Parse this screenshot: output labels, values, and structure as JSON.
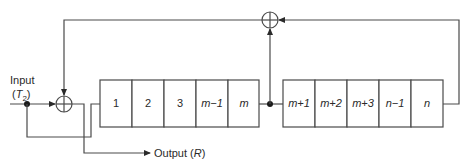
{
  "diagram": {
    "type": "shift-register-with-xor-feedback",
    "input": {
      "label": "Input",
      "sublabel_main": "T",
      "sublabel_sub": "2"
    },
    "output": {
      "label": "Output",
      "symbol": "R"
    },
    "register_a": {
      "cells": [
        {
          "label": "1",
          "italic": false
        },
        {
          "label": "2",
          "italic": false
        },
        {
          "label": "3",
          "italic": false
        },
        {
          "label": "m−1",
          "italic": true
        },
        {
          "label": "m",
          "italic": true
        }
      ]
    },
    "register_b": {
      "cells": [
        {
          "label": "m+1",
          "italic": true
        },
        {
          "label": "m+2",
          "italic": true
        },
        {
          "label": "m+3",
          "italic": true
        },
        {
          "label": "n−1",
          "italic": true
        },
        {
          "label": "n",
          "italic": true
        }
      ]
    },
    "xor_gates": [
      {
        "id": "xor-input",
        "symbol": "⊕"
      },
      {
        "id": "xor-feedback",
        "symbol": "⊕"
      }
    ],
    "colors": {
      "line": "#4a4a4a",
      "text": "#2a2a2a",
      "background": "#ffffff"
    }
  }
}
